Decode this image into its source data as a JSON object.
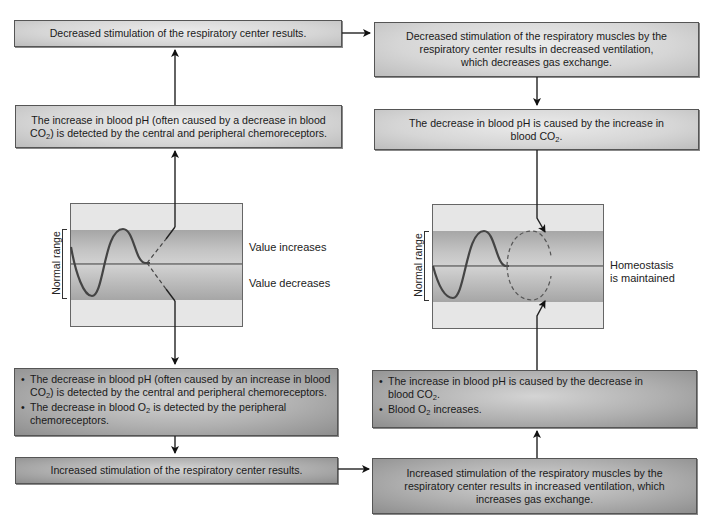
{
  "left_column": {
    "box_top": {
      "text": "Decreased stimulation of the respiratory center results."
    },
    "box_detect_increase": {
      "line1": "The increase in blood pH (often caused by a decrease in blood",
      "line2_pre": "CO",
      "line2_sub": "2",
      "line2_post": ") is detected by the central and peripheral chemoreceptors."
    },
    "graph": {
      "y_label": "Normal range",
      "label_up": "Value increases",
      "label_down": "Value decreases"
    },
    "box_detect_decrease": {
      "bullets": [
        {
          "pre": "The decrease in blood pH (often caused by an increase in blood CO",
          "sub": "2",
          "post": ") is detected by the central and peripheral chemoreceptors."
        },
        {
          "pre": "The decrease in blood O",
          "sub": "2",
          "post": " is detected by the peripheral chemoreceptors."
        }
      ]
    },
    "box_bottom": {
      "text": "Increased stimulation of the respiratory center results."
    }
  },
  "right_column": {
    "box_top": {
      "text": "Decreased stimulation of the respiratory muscles by the respiratory center results in decreased ventilation, which decreases gas exchange."
    },
    "box_ph_decrease": {
      "pre": "The decrease in blood pH is caused by the increase in blood CO",
      "sub": "2",
      "post": "."
    },
    "graph": {
      "y_label": "Normal range",
      "label_line1": "Homeostasis",
      "label_line2": "is maintained"
    },
    "box_ph_increase": {
      "bullets": [
        {
          "pre": "The increase in blood pH is caused by the decrease in blood CO",
          "sub": "2",
          "post": "."
        },
        {
          "pre": "Blood O",
          "sub": "2",
          "post": " increases."
        }
      ]
    },
    "box_bottom": {
      "text": "Increased stimulation of the respiratory muscles by the respiratory center results in increased ventilation, which increases gas exchange."
    }
  },
  "colors": {
    "band_dark": "#a8a8a8",
    "band_light": "#e6e6e6",
    "line": "#222222",
    "curve": "#3a3a3a"
  }
}
